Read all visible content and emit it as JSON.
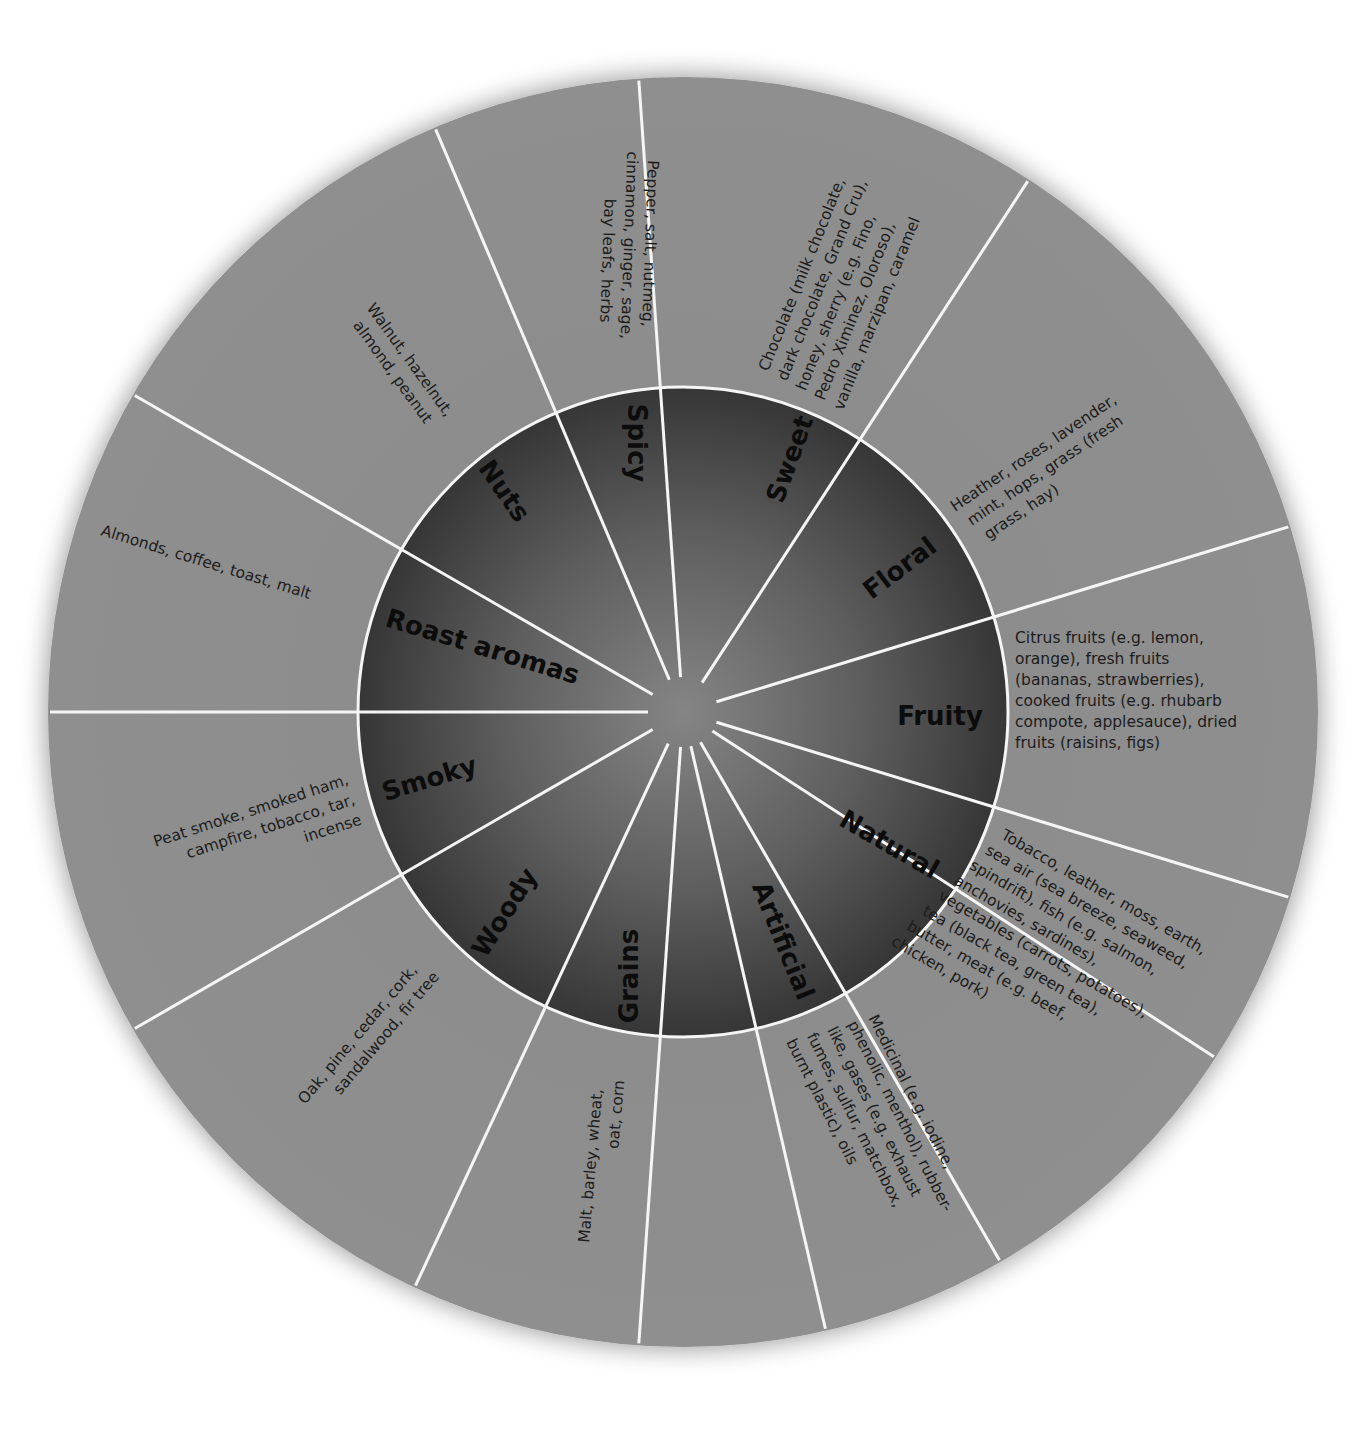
{
  "colors": {
    "background": "#ffffff",
    "outer_ring": "#8c8c8c",
    "inner_ring_edge": "#3a3a3a",
    "inner_ring_center": "#7e7e7e",
    "divider": "#f5f5f5",
    "text": "#111111"
  },
  "geometry": {
    "center_x": 683,
    "center_y": 712,
    "outer_radius": 635,
    "inner_radius": 325,
    "hub_radius": 35
  },
  "chart_data": {
    "type": "wheel",
    "title": "",
    "rings": [
      "category",
      "descriptors"
    ],
    "segments": [
      {
        "category": "Fruity",
        "descriptors": "Citrus fruits (e.g. lemon, orange), fresh fruits (bananas, strawberries), cooked fruits (e.g. rhubarb compote, applesauce), dried fruits (raisins, figs)"
      },
      {
        "category": "Natural",
        "descriptors": "Tobacco, leather, moss, earth, sea air (sea breeze, seaweed, spindrift), fish (e.g. salmon, anchovies, sardines), vegetables (carrots, potatoes), tea (black tea, green tea), butter, meat (e.g. beef, chicken, pork)"
      },
      {
        "category": "Artificial",
        "descriptors": "Medicinal (e.g. iodine, phenolic, menthol), rubber-like, gases (e.g. exhaust fumes, sulfur, matchbox, burnt plastic), oils"
      },
      {
        "category": "Grains",
        "descriptors": "Malt, barley, wheat, oat, corn"
      },
      {
        "category": "Woody",
        "descriptors": "Oak, pine, cedar, cork, sandalwood, fir tree"
      },
      {
        "category": "Smoky",
        "descriptors": "Peat smoke, smoked ham, campfire, tobacco, tar, incense"
      },
      {
        "category": "Roast aromas",
        "descriptors": "Almonds, coffee, toast, malt"
      },
      {
        "category": "Nuts",
        "descriptors": "Walnut, hazelnut, almond, peanut"
      },
      {
        "category": "Spicy",
        "descriptors": "Pepper, salt, nutmeg, cinnamon, ginger, sage, bay leafs, herbs"
      },
      {
        "category": "Sweet",
        "descriptors": "Chocolate (milk chocolate, dark chocolate, Grand Cru), honey, sherry (e.g. Fino, Pedro Ximinez, Oloroso), vanilla, marzipan, caramel"
      },
      {
        "category": "Floral",
        "descriptors": "Heather, roses, lavender, mint, hops, grass (fresh grass, hay)"
      }
    ]
  },
  "wheel": {
    "dividers_deg": [
      -17,
      17,
      33,
      60,
      77,
      94,
      115,
      150,
      180,
      210,
      247,
      266,
      303
    ],
    "categories": {
      "fruity": "Fruity",
      "natural": "Natural",
      "artificial": "Artificial",
      "grains": "Grains",
      "woody": "Woody",
      "smoky": "Smoky",
      "roast": "Roast aromas",
      "nuts": "Nuts",
      "spicy": "Spicy",
      "sweet": "Sweet",
      "floral": "Floral"
    },
    "descriptors": {
      "fruity": [
        "Citrus fruits (e.g. lemon,",
        "orange), fresh fruits",
        "(bananas, strawberries),",
        "cooked fruits (e.g. rhubarb",
        "compote, applesauce), dried",
        "fruits (raisins, figs)"
      ],
      "natural": [
        "Tobacco, leather, moss, earth,",
        "sea air (sea breeze, seaweed,",
        "spindrift), fish (e.g. salmon,",
        "anchovies, sardines),",
        "vegetables (carrots, potatoes),",
        "tea (black tea, green tea),",
        "butter, meat (e.g. beef,",
        "chicken, pork)"
      ],
      "artificial": [
        "Medicinal (e.g. iodine,",
        "phenolic, menthol), rubber-",
        "like, gases (e.g. exhaust",
        "fumes, sulfur, matchbox,",
        "burnt plastic), oils"
      ],
      "grains": [
        "Malt, barley, wheat,",
        "oat, corn"
      ],
      "woody": [
        "Oak, pine, cedar, cork,",
        "sandalwood, fir tree"
      ],
      "smoky": [
        "Peat smoke, smoked ham,",
        "campfire, tobacco, tar,",
        "incense"
      ],
      "roast": [
        "Almonds, coffee, toast, malt"
      ],
      "nuts": [
        "Walnut, hazelnut,",
        "almond, peanut"
      ],
      "spicy": [
        "Pepper, salt, nutmeg,",
        "cinnamon, ginger, sage,",
        "bay leafs, herbs"
      ],
      "sweet": [
        "Chocolate (milk chocolate,",
        "dark chocolate, Grand Cru),",
        "honey, sherry (e.g. Fino,",
        "Pedro Ximinez, Oloroso),",
        "vanilla, marzipan, caramel"
      ],
      "floral": [
        "Heather, roses, lavender,",
        "mint, hops, grass (fresh",
        "grass, hay)"
      ]
    }
  }
}
